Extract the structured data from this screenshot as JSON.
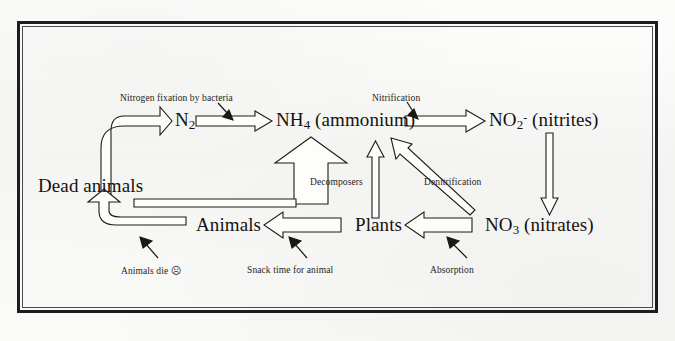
{
  "document": {
    "kind": "nitrogen-cycle-diagram",
    "title": "Nitrogen Cycle",
    "background_color": "#fbfbfa",
    "ink_color": "#15120f",
    "frame": {
      "style": "double-rule-border",
      "outer_color": "#1d1d1d",
      "inner_color": "#4a4a4a"
    }
  },
  "nodes": [
    {
      "id": "n2",
      "label": "N",
      "sub": "2",
      "sup": "",
      "suffix": "",
      "x": 175,
      "y": 120
    },
    {
      "id": "nh4",
      "label": "NH",
      "sub": "4",
      "sup": "",
      "suffix": " (ammonium)",
      "x": 276,
      "y": 120
    },
    {
      "id": "no2",
      "label": "NO",
      "sub": "2",
      "sup": "-",
      "suffix": " (nitrites)",
      "x": 489,
      "y": 120
    },
    {
      "id": "no3",
      "label": "NO",
      "sub": "3",
      "sup": "",
      "suffix": " (nitrates)",
      "x": 485,
      "y": 225
    },
    {
      "id": "deadanimals",
      "label": "Dead animals",
      "sub": "",
      "sup": "",
      "suffix": "",
      "x": 38,
      "y": 186
    },
    {
      "id": "animals",
      "label": "Animals",
      "sub": "",
      "sup": "",
      "suffix": "",
      "x": 196,
      "y": 225
    },
    {
      "id": "plants",
      "label": "Plants",
      "sub": "",
      "sup": "",
      "suffix": "",
      "x": 355,
      "y": 225
    }
  ],
  "captions": [
    {
      "id": "nitrogen-fixation",
      "text": "Nitrogen fixation by bacteria",
      "x": 120,
      "y": 94
    },
    {
      "id": "nitrification",
      "text": "Nitrification",
      "x": 372,
      "y": 94
    },
    {
      "id": "decomposers",
      "text": "Decomposers",
      "x": 310,
      "y": 178
    },
    {
      "id": "denitrification",
      "text": "Denitrification",
      "x": 424,
      "y": 178
    },
    {
      "id": "animals-die",
      "text": "Animals die",
      "x": 121,
      "y": 266,
      "emoji": "☹"
    },
    {
      "id": "snack-time",
      "text": "Snack time for animal",
      "x": 247,
      "y": 266
    },
    {
      "id": "absorption",
      "text": "Absorption",
      "x": 430,
      "y": 266
    }
  ],
  "flows": [
    {
      "id": "n2-to-nh4",
      "from": "N2",
      "to": "NH4",
      "process": "Nitrogen fixation by bacteria"
    },
    {
      "id": "nh4-to-no2",
      "from": "NH4",
      "to": "NO2",
      "process": "Nitrification"
    },
    {
      "id": "no2-to-no3",
      "from": "NO2",
      "to": "NO3",
      "process": "Nitrification"
    },
    {
      "id": "no3-to-nh4",
      "from": "NO3",
      "to": "NH4",
      "process": "Denitrification"
    },
    {
      "id": "no3-to-plants",
      "from": "NO3",
      "to": "Plants",
      "process": "Absorption"
    },
    {
      "id": "plants-to-nh4",
      "from": "Plants",
      "to": "NH4",
      "process": ""
    },
    {
      "id": "plants-to-animals",
      "from": "Plants",
      "to": "Animals",
      "process": "Snack time for animal"
    },
    {
      "id": "animals-to-dead",
      "from": "Animals",
      "to": "Dead animals",
      "process": "Animals die"
    },
    {
      "id": "dead-to-decomposers",
      "from": "Dead animals",
      "to": "NH4",
      "process": "Decomposers"
    },
    {
      "id": "dead-to-n2",
      "from": "Dead animals",
      "to": "N2",
      "process": ""
    }
  ]
}
